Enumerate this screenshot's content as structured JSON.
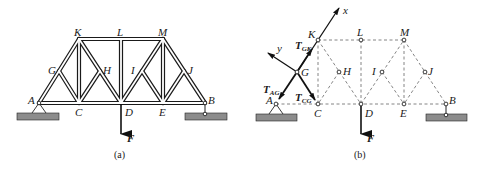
{
  "figure_a": {
    "caption": "(a)",
    "nodes": {
      "A": {
        "label": "A",
        "x": 39,
        "y": 103
      },
      "G": {
        "label": "G",
        "x": 59,
        "y": 71
      },
      "K": {
        "label": "K",
        "x": 79,
        "y": 39
      },
      "C": {
        "label": "C",
        "x": 79,
        "y": 103
      },
      "H": {
        "label": "H",
        "x": 100,
        "y": 71
      },
      "L": {
        "label": "L",
        "x": 121,
        "y": 39
      },
      "D": {
        "label": "D",
        "x": 121,
        "y": 103
      },
      "I": {
        "label": "I",
        "x": 142,
        "y": 71
      },
      "M": {
        "label": "M",
        "x": 163,
        "y": 39
      },
      "E": {
        "label": "E",
        "x": 163,
        "y": 103
      },
      "J": {
        "label": "J",
        "x": 184,
        "y": 71
      },
      "B": {
        "label": "B",
        "x": 205,
        "y": 103
      }
    },
    "members": [
      [
        "A",
        "G"
      ],
      [
        "G",
        "K"
      ],
      [
        "K",
        "L"
      ],
      [
        "L",
        "M"
      ],
      [
        "M",
        "J"
      ],
      [
        "J",
        "B"
      ],
      [
        "A",
        "C"
      ],
      [
        "C",
        "D"
      ],
      [
        "D",
        "E"
      ],
      [
        "E",
        "B"
      ],
      [
        "G",
        "C"
      ],
      [
        "K",
        "C"
      ],
      [
        "K",
        "H"
      ],
      [
        "H",
        "D"
      ],
      [
        "H",
        "C"
      ],
      [
        "L",
        "D"
      ],
      [
        "D",
        "I"
      ],
      [
        "I",
        "M"
      ],
      [
        "I",
        "E"
      ],
      [
        "M",
        "E"
      ],
      [
        "E",
        "J"
      ]
    ],
    "force": {
      "label": "F",
      "at": "D"
    }
  },
  "figure_b": {
    "caption": "(b)",
    "nodes": {
      "A": {
        "label": "A",
        "x": 276,
        "y": 104
      },
      "G": {
        "label": "G",
        "x": 297,
        "y": 72
      },
      "K": {
        "label": "K",
        "x": 318,
        "y": 40
      },
      "C": {
        "label": "C",
        "x": 318,
        "y": 104
      },
      "H": {
        "label": "H",
        "x": 339,
        "y": 72
      },
      "L": {
        "label": "L",
        "x": 361,
        "y": 40
      },
      "D": {
        "label": "D",
        "x": 361,
        "y": 104
      },
      "I": {
        "label": "I",
        "x": 382,
        "y": 72
      },
      "M": {
        "label": "M",
        "x": 404,
        "y": 40
      },
      "E": {
        "label": "E",
        "x": 404,
        "y": 104
      },
      "J": {
        "label": "J",
        "x": 425,
        "y": 72
      },
      "B": {
        "label": "B",
        "x": 446,
        "y": 104
      }
    },
    "axes": {
      "x_label": "x",
      "y_label": "y"
    },
    "forces": {
      "T_GK": {
        "main": "T",
        "sub": "GK"
      },
      "T_AG": {
        "main": "T",
        "sub": "AG"
      },
      "T_CG": {
        "main": "T",
        "sub": "CG"
      },
      "F": {
        "main": "F"
      }
    }
  }
}
